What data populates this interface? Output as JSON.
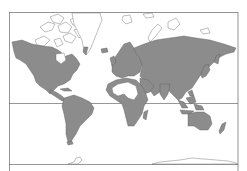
{
  "map": {
    "projection": "Mercator",
    "style": "world map, shaded regions",
    "colors": {
      "shaded_land": "#8c8c8c",
      "unshaded_land": "#ffffff",
      "outline": "#5a5a5a",
      "background": "#ffffff",
      "lines": "#6a6a6a"
    },
    "lines": [
      {
        "name": "equator",
        "y": 103
      },
      {
        "name": "southern-boundary",
        "y": 164
      }
    ],
    "shaded_regions": [
      "North America",
      "Central America",
      "South America",
      "Europe",
      "Asia",
      "Africa (except Sahara)",
      "Australia",
      "Southeast Asia islands",
      "Japan",
      "New Zealand",
      "Madagascar",
      "British Isles"
    ],
    "unshaded_regions": [
      "Greenland",
      "Canadian Arctic Archipelago",
      "Svalbard",
      "Novaya Zemlya",
      "Sahara Desert",
      "Antarctica",
      "Iceland"
    ]
  }
}
